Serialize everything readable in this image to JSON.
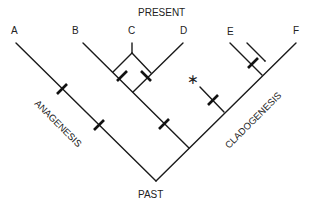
{
  "diagram": {
    "type": "cladogram",
    "top_label": "PRESENT",
    "bottom_label": "PAST",
    "left_annotation": "ANAGENESIS",
    "right_annotation": "CLADOGENESIS",
    "taxa": [
      "A",
      "B",
      "C",
      "D",
      "E",
      "F"
    ],
    "extinct_marker": "∗",
    "colors": {
      "line": "#1a1a1a",
      "text": "#222222",
      "background": "#ffffff"
    }
  }
}
